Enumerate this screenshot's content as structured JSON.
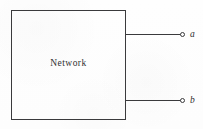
{
  "figure": {
    "type": "two-terminal-network-block-diagram",
    "background_color": "#fefefe",
    "line_color": "#3a3a3c",
    "block": {
      "label": "Network"
    },
    "terminals": [
      {
        "id": "a",
        "label": "a",
        "position": "top-right",
        "marker": "open-circle"
      },
      {
        "id": "b",
        "label": "b",
        "position": "bottom-right",
        "marker": "open-circle"
      }
    ],
    "leads": [
      {
        "id": "lead-a",
        "from": "network-block-right-edge",
        "to": "terminal-a"
      },
      {
        "id": "lead-b",
        "from": "network-block-right-edge",
        "to": "terminal-b"
      }
    ]
  }
}
